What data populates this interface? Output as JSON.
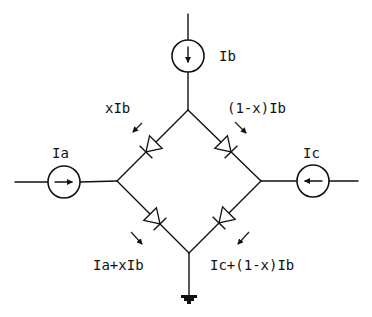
{
  "diagram": {
    "type": "current-steering diode bridge",
    "labels": {
      "ib": "Ib",
      "ia": "Ia",
      "ic": "Ic",
      "x_ib": "xIb",
      "one_minus_x_ib": "(1-x)Ib",
      "ia_plus_x_ib": "Ia+xIb",
      "ic_plus_one_minus_x_ib": "Ic+(1-x)Ib"
    },
    "sources": [
      {
        "name": "Ib",
        "direction": "down"
      },
      {
        "name": "Ia",
        "direction": "right"
      },
      {
        "name": "Ic",
        "direction": "left"
      }
    ],
    "diodes": [
      {
        "position": "upper-left",
        "conducts": "top to left"
      },
      {
        "position": "upper-right",
        "conducts": "top to right"
      },
      {
        "position": "lower-left",
        "conducts": "left to bottom"
      },
      {
        "position": "lower-right",
        "conducts": "right to bottom"
      }
    ],
    "ground": "bottom node",
    "colors": {
      "line": "#111111",
      "background": "#ffffff"
    }
  }
}
